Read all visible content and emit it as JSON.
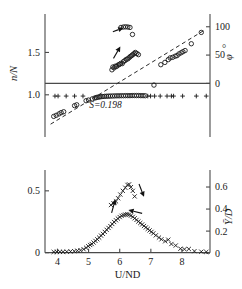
{
  "chart_data": {
    "type": "scatter",
    "title": "",
    "xlabel": "U/ND",
    "xlim": [
      3.6,
      8.9
    ],
    "xticks": [
      4,
      5,
      6,
      7,
      8
    ],
    "xticklabels": [
      "4",
      "5",
      "6",
      "7",
      "8"
    ],
    "grid": false,
    "legend_position": "none",
    "panels": [
      {
        "name": "upper-panel",
        "ylabel_left": "n/N",
        "ylim_left": [
          0.62,
          1.93
        ],
        "yticks_left": [
          1.0,
          1.5
        ],
        "yticklabels_left": [
          "1.0",
          "1.5"
        ],
        "ylabel_right": "φ",
        "ylabel_right_unit": "°",
        "ylim_right": [
          -77,
          119
        ],
        "yticks_right": [
          0,
          50,
          100
        ],
        "yticklabels_right": [
          "0",
          "50",
          "100"
        ],
        "annotations": [
          {
            "text": "S=0.198",
            "x": 5.02,
            "y": 0.845
          }
        ],
        "series": [
          {
            "name": "frequency-ratio-branch-upper",
            "marker": "circle",
            "axis": "left",
            "x": [
              5.75,
              5.78,
              5.82,
              5.86,
              5.9,
              5.95,
              5.99,
              6.03,
              6.08,
              6.12,
              6.17,
              6.21,
              6.26,
              6.3,
              6.34,
              6.38,
              6.42,
              6.46,
              6.5,
              6.55,
              6.6
            ],
            "y": [
              1.295,
              1.328,
              1.318,
              1.338,
              1.335,
              1.352,
              1.358,
              1.37,
              1.368,
              1.392,
              1.404,
              1.418,
              1.424,
              1.438,
              1.452,
              1.462,
              1.474,
              1.486,
              1.5,
              1.488,
              1.474
            ]
          },
          {
            "name": "frequency-ratio-branch-top",
            "marker": "circle",
            "axis": "left",
            "x": [
              6.04,
              6.12,
              6.19,
              6.26,
              6.33,
              6.41
            ],
            "y": [
              1.795,
              1.8,
              1.802,
              1.8,
              1.795,
              1.712
            ]
          },
          {
            "name": "frequency-ratio-lock-in",
            "marker": "circle",
            "axis": "left",
            "x": [
              3.88,
              3.96,
              4.05,
              4.12,
              4.2,
              4.55,
              4.62,
              4.92,
              5.0,
              5.12,
              5.2,
              5.25,
              5.3,
              5.35,
              5.4,
              5.46,
              5.52,
              5.58,
              5.64,
              5.7,
              5.77,
              5.84,
              5.91,
              5.98,
              6.05,
              6.12,
              6.19,
              6.26,
              6.33,
              6.4,
              6.47,
              6.54,
              6.61,
              6.68,
              6.75,
              6.82
            ],
            "y": [
              0.745,
              0.758,
              0.775,
              0.79,
              0.8,
              0.872,
              0.882,
              0.93,
              0.938,
              0.952,
              0.962,
              0.968,
              0.972,
              0.975,
              0.978,
              0.98,
              0.982,
              0.983,
              0.984,
              0.985,
              0.986,
              0.987,
              0.988,
              0.988,
              0.989,
              0.989,
              0.99,
              0.99,
              0.99,
              0.991,
              0.991,
              0.991,
              0.991,
              0.99,
              0.99,
              0.989
            ]
          },
          {
            "name": "phase-angle-data",
            "marker": "circle",
            "axis": "right",
            "x": [
              7.1,
              7.32,
              7.45,
              7.56,
              7.62,
              7.7,
              7.78,
              7.84,
              7.9,
              7.97,
              8.03,
              8.1,
              8.3,
              8.62
            ],
            "y": [
              -3.0,
              33.0,
              37.0,
              42.0,
              45.0,
              46.0,
              48.0,
              49.0,
              52.0,
              54.0,
              56.0,
              58.0,
              70.0,
              90.0
            ]
          },
          {
            "name": "amplitude-zero-plus-markers",
            "marker": "plus",
            "axis": "left",
            "x": [
              3.92,
              4.02,
              4.28,
              4.55,
              4.82,
              6.9,
              6.99,
              7.12,
              7.3,
              7.52,
              7.66,
              7.73,
              8.02,
              8.46,
              8.78
            ],
            "y": [
              0.985,
              0.985,
              0.985,
              0.985,
              0.985,
              0.985,
              0.985,
              0.985,
              0.985,
              0.985,
              0.985,
              0.985,
              0.985,
              0.985,
              0.985
            ]
          }
        ],
        "fit_line": {
          "name": "strouhal-dashed-line",
          "style": "dashed",
          "x": [
            3.78,
            8.72
          ],
          "y_right": [
            -72,
            94
          ]
        },
        "arrows": [
          {
            "name": "arrow-to-top-branch",
            "x1": 5.78,
            "y1": 1.745,
            "x2": 6.12,
            "y2": 1.79
          },
          {
            "name": "arrow-to-upper-branch",
            "x1": 5.8,
            "y1": 1.43,
            "x2": 6.02,
            "y2": 1.57
          }
        ]
      },
      {
        "name": "lower-panel",
        "ylabel_left": "",
        "ylim_left": [
          -0.035,
          0.62
        ],
        "yticks_left": [
          0,
          0.5
        ],
        "yticklabels_left": [
          "0",
          "0.5"
        ],
        "ylabel_right": "Ȳ/D",
        "ylim_right": [
          -0.035,
          0.7
        ],
        "yticks_right": [
          0,
          0.2,
          0.4,
          0.6
        ],
        "yticklabels_right": [
          "0",
          "0.2",
          "0.4",
          "0.6"
        ],
        "series": [
          {
            "name": "amplitude-response-upper",
            "marker": "cross",
            "axis": "left",
            "x": [
              5.72,
              5.8,
              5.88,
              5.95,
              6.02,
              6.1,
              6.18,
              6.25,
              6.3,
              6.36,
              6.42,
              6.48
            ],
            "y": [
              0.385,
              0.4,
              0.415,
              0.44,
              0.47,
              0.5,
              0.525,
              0.548,
              0.552,
              0.53,
              0.5,
              0.455
            ]
          },
          {
            "name": "amplitude-response-lower",
            "marker": "cross",
            "axis": "left",
            "x": [
              3.88,
              3.98,
              4.08,
              4.18,
              4.3,
              4.42,
              4.54,
              4.64,
              4.74,
              4.84,
              4.92,
              4.99,
              5.05,
              5.1,
              5.16,
              5.22,
              5.28,
              5.34,
              5.4,
              5.46,
              5.52,
              5.58,
              5.64,
              5.7,
              5.76,
              5.82,
              5.88,
              5.94,
              6.0,
              6.06,
              6.12,
              6.18,
              6.24,
              6.3,
              6.36,
              6.42,
              6.48,
              6.54,
              6.6,
              6.66,
              6.72,
              6.78,
              6.84,
              6.9,
              6.96,
              7.02,
              7.08,
              7.16,
              7.26,
              7.34,
              7.46,
              7.56,
              7.66,
              7.8,
              7.95,
              8.08,
              8.22,
              8.4,
              8.62,
              8.78
            ],
            "y": [
              0.006,
              0.006,
              0.007,
              0.007,
              0.008,
              0.01,
              0.012,
              0.016,
              0.02,
              0.028,
              0.04,
              0.052,
              0.062,
              0.07,
              0.082,
              0.095,
              0.108,
              0.122,
              0.138,
              0.152,
              0.168,
              0.185,
              0.2,
              0.215,
              0.232,
              0.248,
              0.262,
              0.276,
              0.288,
              0.298,
              0.304,
              0.308,
              0.31,
              0.308,
              0.3,
              0.29,
              0.278,
              0.265,
              0.252,
              0.24,
              0.228,
              0.216,
              0.204,
              0.192,
              0.18,
              0.168,
              0.156,
              0.14,
              0.122,
              0.108,
              0.092,
              0.105,
              0.07,
              0.058,
              0.032,
              0.028,
              0.03,
              0.012,
              0.008,
              0.006
            ]
          }
        ],
        "arrows": [
          {
            "name": "arrow-to-upper-amplitude",
            "x1": 5.74,
            "y1": 0.322,
            "x2": 5.86,
            "y2": 0.432
          },
          {
            "name": "arrow-down-right-amplitude",
            "x1": 6.62,
            "y1": 0.555,
            "x2": 6.78,
            "y2": 0.452
          },
          {
            "name": "arrow-to-lower-amplitude",
            "x1": 6.72,
            "y1": 0.318,
            "x2": 6.28,
            "y2": 0.345
          }
        ]
      }
    ]
  },
  "axes": {
    "x_title": "U/ND",
    "upper_left_title": "n/N",
    "upper_right_title": "φ",
    "upper_right_degree": "°",
    "lower_right_title": "Ȳ/D"
  },
  "ticks": {
    "x": [
      "4",
      "5",
      "6",
      "7",
      "8"
    ],
    "upper_left": [
      "1.0",
      "1.5"
    ],
    "upper_right": [
      "0",
      "50",
      "100"
    ],
    "lower_left": [
      "0",
      "0.5"
    ],
    "lower_right": [
      "0",
      "0.2",
      "0.4",
      "0.6"
    ]
  },
  "annotations": {
    "strouhal": "S=0.198"
  },
  "colors": {
    "axis": "#4a4a4a",
    "marker": "#1a1a1a",
    "fit_line": "#2a2a2a",
    "background": "#ffffff"
  }
}
